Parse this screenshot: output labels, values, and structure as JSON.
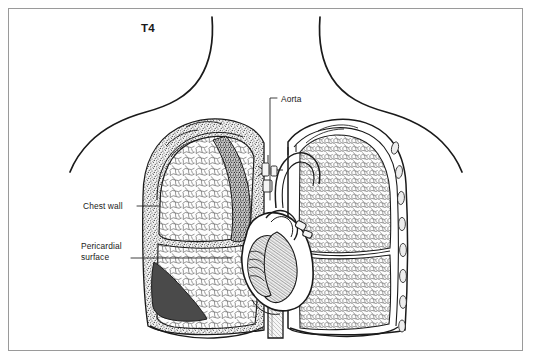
{
  "figure": {
    "domain_kind": "anatomical-illustration",
    "title_label": "T4",
    "background_color": "#ffffff",
    "frame_color": "#9a9a9a",
    "ink_color": "#1a1a1a"
  },
  "labels": {
    "level": "T4",
    "chest_wall": "Chest wall",
    "aorta": "Aorta",
    "pericardial_line1": "Pericardial",
    "pericardial_line2": "surface",
    "pericardial_full": "Pericardial surface"
  },
  "structures": [
    {
      "name": "neck-shoulder-contour-left",
      "kind": "body-outline"
    },
    {
      "name": "neck-shoulder-contour-right",
      "kind": "body-outline"
    },
    {
      "name": "lung-left",
      "kind": "organ",
      "texture": "alveolar-cobblestone"
    },
    {
      "name": "lung-right",
      "kind": "organ",
      "texture": "alveolar-cobblestone"
    },
    {
      "name": "chest-wall",
      "kind": "wall",
      "texture": "stipple"
    },
    {
      "name": "pericardial-surface",
      "kind": "membrane",
      "shade": "#4a4a4a"
    },
    {
      "name": "heart",
      "kind": "organ",
      "texture": "trabeculated"
    },
    {
      "name": "aorta",
      "kind": "vessel"
    },
    {
      "name": "descending-aorta",
      "kind": "vessel"
    },
    {
      "name": "diaphragm",
      "kind": "muscle"
    },
    {
      "name": "ribs",
      "kind": "bone"
    },
    {
      "name": "vertebra-trachea-cluster",
      "kind": "mediastinum"
    }
  ],
  "colors": {
    "ink": "#1a1a1a",
    "stipple": "#555555",
    "dark_shade": "#4a4a4a",
    "light_fill": "#fbfbfb",
    "frame": "#9a9a9a",
    "leader": "#2a2a2a"
  }
}
